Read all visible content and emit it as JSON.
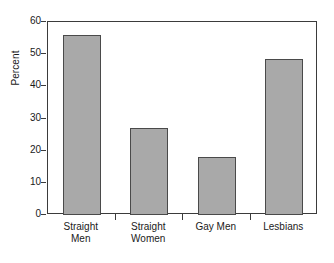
{
  "chart_data": {
    "type": "bar",
    "title": "",
    "subtitle": "",
    "xlabel": "",
    "ylabel": "Percent",
    "categories": [
      "Straight\nMen",
      "Straight\nWomen",
      "Gay Men",
      "Lesbians"
    ],
    "values": [
      56,
      27,
      18,
      48.5
    ],
    "ylim": [
      0,
      60
    ],
    "yticks": [
      0,
      10,
      20,
      30,
      40,
      50,
      60
    ],
    "ytick_labels": [
      "0",
      "10",
      "20",
      "30",
      "40",
      "50",
      "60"
    ],
    "grid": false,
    "legend": null,
    "legend_position": "none",
    "bar_color": "#a9a9a9",
    "bar_edge_color": "#4a4a4a",
    "axis_color": "#3b3b3b",
    "background_color": "#ffffff",
    "annotations": []
  }
}
